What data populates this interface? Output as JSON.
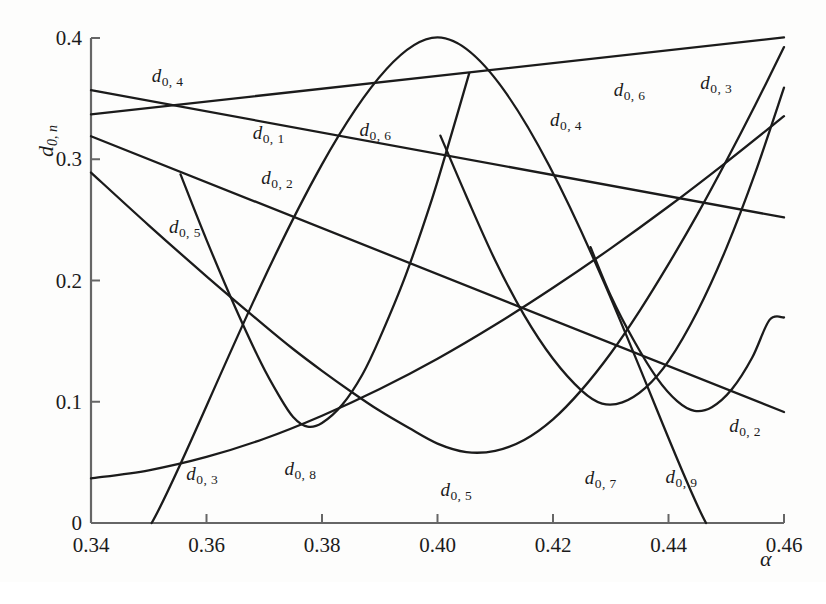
{
  "figure": {
    "background_color": "#fdfdfc",
    "line_color": "#1b1b1b",
    "axis_color": "#555555"
  },
  "axes": {
    "x_title": "α",
    "y_title_main": "d",
    "y_title_sub": "0, n",
    "x_ticks": [
      "0.34",
      "0.36",
      "0.38",
      "0.40",
      "0.42",
      "0.44",
      "0.46"
    ],
    "y_ticks": [
      "0",
      "0.1",
      "0.2",
      "0.3",
      "0.4"
    ],
    "x_min": 0.34,
    "x_max": 0.46,
    "y_min": 0.0,
    "y_max": 0.4
  },
  "chart_data": {
    "type": "line",
    "title": "",
    "xlabel": "α",
    "ylabel": "d_{0,n}",
    "xlim": [
      0.34,
      0.46
    ],
    "ylim": [
      0.0,
      0.4
    ],
    "grid": false,
    "legend": "inline-curve-labels",
    "x_ticks": [
      0.34,
      0.36,
      0.38,
      0.4,
      0.42,
      0.44,
      0.46
    ],
    "y_ticks": [
      0.0,
      0.1,
      0.2,
      0.3,
      0.4
    ],
    "series": [
      {
        "name": "d_0,1",
        "label": "d_0,1",
        "label_at": [
          0.368,
          0.33
        ],
        "points": [
          [
            0.34,
            0.337
          ],
          [
            0.46,
            0.4005
          ]
        ]
      },
      {
        "name": "d_0,2",
        "label": "d_0,2",
        "label_at": [
          0.3695,
          0.293
        ],
        "label2": "d_0,2",
        "label2_at": [
          0.4505,
          0.088
        ],
        "points": [
          [
            0.34,
            0.319
          ],
          [
            0.46,
            0.0915
          ]
        ]
      },
      {
        "name": "d_0,3",
        "label": "d_0,3",
        "label_at": [
          0.3565,
          0.049
        ],
        "label2": "d_0,3",
        "label2_at": [
          0.4455,
          0.371
        ],
        "points": [
          [
            0.34,
            0.0368
          ],
          [
            0.35,
            0.0435
          ],
          [
            0.36,
            0.0545
          ],
          [
            0.37,
            0.0695
          ],
          [
            0.38,
            0.0885
          ],
          [
            0.39,
            0.1105
          ],
          [
            0.4,
            0.1355
          ],
          [
            0.41,
            0.1635
          ],
          [
            0.42,
            0.194
          ],
          [
            0.43,
            0.2265
          ],
          [
            0.44,
            0.261
          ],
          [
            0.45,
            0.2975
          ],
          [
            0.46,
            0.3355
          ]
        ]
      },
      {
        "name": "d_0,4",
        "label": "d_0,4",
        "label_at": [
          0.3505,
          0.3765
        ],
        "label2": "d_0,4",
        "label2_at": [
          0.4195,
          0.3405
        ],
        "points": [
          [
            0.34,
            0.357
          ],
          [
            0.46,
            0.252
          ]
        ]
      },
      {
        "name": "d_0,5",
        "label": "d_0,5",
        "label_at": [
          0.3535,
          0.252
        ],
        "label2": "d_0,5",
        "label2_at": [
          0.4005,
          0.0355
        ],
        "points": [
          [
            0.34,
            0.289
          ],
          [
            0.35,
            0.2455
          ],
          [
            0.36,
            0.2035
          ],
          [
            0.37,
            0.163
          ],
          [
            0.375,
            0.1435
          ],
          [
            0.38,
            0.1255
          ],
          [
            0.385,
            0.1085
          ],
          [
            0.39,
            0.0925
          ],
          [
            0.395,
            0.0785
          ],
          [
            0.4,
            0.0655
          ],
          [
            0.405,
            0.0585
          ],
          [
            0.41,
            0.0595
          ],
          [
            0.415,
            0.0685
          ],
          [
            0.42,
            0.0855
          ],
          [
            0.425,
            0.11
          ],
          [
            0.43,
            0.14
          ],
          [
            0.435,
            0.175
          ],
          [
            0.44,
            0.2135
          ],
          [
            0.445,
            0.2545
          ],
          [
            0.45,
            0.2985
          ],
          [
            0.455,
            0.3445
          ],
          [
            0.46,
            0.3925
          ]
        ]
      },
      {
        "name": "d_0,6",
        "label": "d_0,6",
        "label_at": [
          0.3865,
          0.332
        ],
        "label2": "d_0,6",
        "label2_at": [
          0.4305,
          0.3655
        ],
        "points": [
          [
            0.3505,
            0.0
          ],
          [
            0.4,
            0.4005
          ],
          [
            0.4465,
            0.0
          ]
        ]
      },
      {
        "name": "d_0,7",
        "label": "d_0,7",
        "label_at": [
          0.4255,
          0.0455
        ],
        "points": [
          [
            0.4005,
            0.3195
          ],
          [
            0.405,
            0.2695
          ],
          [
            0.41,
            0.2165
          ],
          [
            0.415,
            0.1715
          ],
          [
            0.42,
            0.1355
          ],
          [
            0.425,
            0.109
          ],
          [
            0.4285,
            0.0985
          ],
          [
            0.432,
            0.0995
          ],
          [
            0.436,
            0.1115
          ],
          [
            0.44,
            0.1335
          ],
          [
            0.445,
            0.1745
          ],
          [
            0.45,
            0.2265
          ],
          [
            0.455,
            0.2885
          ],
          [
            0.46,
            0.359
          ]
        ]
      },
      {
        "name": "d_0,8",
        "label": "d_0,8",
        "label_at": [
          0.3735,
          0.0525
        ],
        "points": [
          [
            0.3555,
            0.2875
          ],
          [
            0.36,
            0.2335
          ],
          [
            0.365,
            0.1775
          ],
          [
            0.3695,
            0.1315
          ],
          [
            0.3725,
            0.1055
          ],
          [
            0.375,
            0.0875
          ],
          [
            0.3775,
            0.0795
          ],
          [
            0.38,
            0.0825
          ],
          [
            0.3835,
            0.0975
          ],
          [
            0.387,
            0.1225
          ],
          [
            0.39,
            0.1525
          ],
          [
            0.3945,
            0.2045
          ],
          [
            0.399,
            0.2665
          ],
          [
            0.4025,
            0.322
          ],
          [
            0.4055,
            0.371
          ]
        ]
      },
      {
        "name": "d_0,9",
        "label": "d_0,9",
        "label_at": [
          0.4395,
          0.0465
        ],
        "points": [
          [
            0.4265,
            0.2275
          ],
          [
            0.43,
            0.1875
          ],
          [
            0.434,
            0.1505
          ],
          [
            0.438,
            0.1195
          ],
          [
            0.4415,
            0.1005
          ],
          [
            0.4445,
            0.0925
          ],
          [
            0.4475,
            0.0955
          ],
          [
            0.451,
            0.1105
          ],
          [
            0.4545,
            0.1365
          ],
          [
            0.4575,
            0.1675
          ],
          [
            0.46,
            0.1695
          ]
        ]
      }
    ]
  }
}
